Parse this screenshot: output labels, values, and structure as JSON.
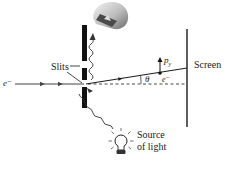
{
  "diagram": {
    "labels": {
      "slits": "Slits",
      "screen": "Screen",
      "source_line1": "Source",
      "source_line2": "of light",
      "electron_incoming": "e⁻",
      "electron_deflected": "e⁻",
      "angle": "θ",
      "momentum_symbol": "p",
      "momentum_subscript": "y"
    },
    "colors": {
      "ink": "#1a1a1a",
      "barrier": "#111111",
      "microscope_light": "#e8e8e8",
      "microscope_dark": "#555555",
      "background": "#ffffff"
    },
    "elements": {
      "barrier": {
        "x": 82,
        "width": 5,
        "segments": [
          [
            25,
            61
          ],
          [
            68,
            80
          ],
          [
            87,
            108
          ]
        ]
      },
      "screen": {
        "x": 187,
        "y1": 29,
        "y2": 127
      },
      "incoming_path": {
        "y": 84,
        "x1": 15,
        "x2": 84
      },
      "deflected_path": {
        "from": [
          86,
          84
        ],
        "to": [
          187,
          68
        ]
      },
      "axis_dashed": {
        "from": [
          88,
          84
        ],
        "to": [
          187,
          84
        ]
      },
      "electron_dot": {
        "x": 160,
        "y": 73
      },
      "light_bulb": {
        "cx": 121,
        "cy": 143
      }
    }
  }
}
